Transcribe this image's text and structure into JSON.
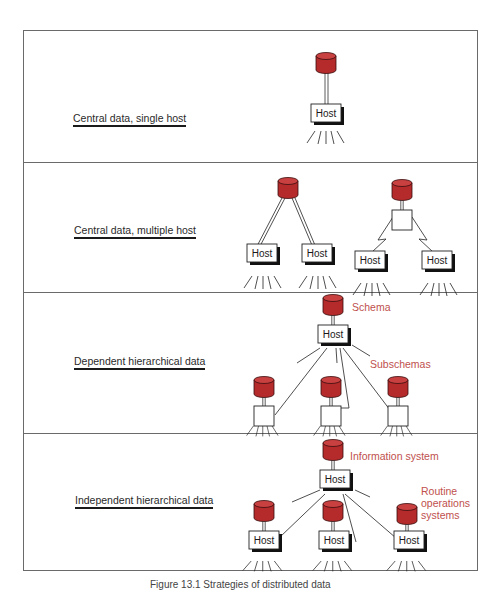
{
  "figure": {
    "caption": "Figure 13.1  Strategies of distributed data",
    "colors": {
      "database": "#b52a2a",
      "database_top": "#c94040",
      "annotation": "#c0504d",
      "line": "#1a1a1a",
      "frame": "#6a6a6a"
    }
  },
  "sections": [
    {
      "label": "Central data, single host",
      "nodes": [
        {
          "type": "database"
        },
        {
          "type": "host",
          "label": "Host"
        }
      ]
    },
    {
      "label": "Central data, multiple host",
      "nodes": [
        {
          "type": "database"
        },
        {
          "type": "host",
          "label": "Host"
        },
        {
          "type": "host",
          "label": "Host"
        },
        {
          "type": "database"
        },
        {
          "type": "processor"
        },
        {
          "type": "host",
          "label": "Host"
        },
        {
          "type": "host",
          "label": "Host"
        }
      ]
    },
    {
      "label": "Dependent hierarchical data",
      "annotations": [
        "Schema",
        "Subschemas"
      ],
      "nodes": [
        {
          "type": "database"
        },
        {
          "type": "host",
          "label": "Host"
        },
        {
          "type": "database"
        },
        {
          "type": "processor"
        },
        {
          "type": "database"
        },
        {
          "type": "processor"
        },
        {
          "type": "database"
        },
        {
          "type": "processor"
        }
      ]
    },
    {
      "label": "Independent hierarchical data",
      "annotations": [
        "Information system",
        "Routine",
        "operations",
        "systems"
      ],
      "nodes": [
        {
          "type": "database"
        },
        {
          "type": "host",
          "label": "Host"
        },
        {
          "type": "database"
        },
        {
          "type": "host",
          "label": "Host"
        },
        {
          "type": "database"
        },
        {
          "type": "host",
          "label": "Host"
        },
        {
          "type": "database"
        },
        {
          "type": "host",
          "label": "Host"
        }
      ]
    }
  ],
  "host_label": "Host"
}
